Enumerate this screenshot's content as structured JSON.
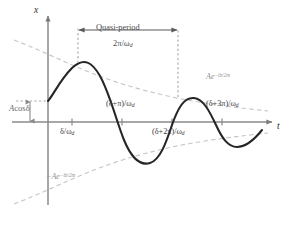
{
  "figure": {
    "background": "#ffffff",
    "curve_color": "#262626",
    "envelope_color": "#c2c2c2",
    "axis_color": "#8a8a8a",
    "dotted_color": "#a8a8a8"
  },
  "axes": {
    "x_axis_label": "x",
    "t_axis_label": "t"
  },
  "annotations": {
    "quasi_period_label": "Quasi-period",
    "quasi_period_value_num": "2π",
    "quasi_period_value_den": "ω",
    "quasi_period_value_den_sub": "d",
    "amplitude_label_a": "A",
    "amplitude_label_cos": "cos",
    "amplitude_label_delta": "δ",
    "envelope_upper_base": "Ae",
    "envelope_upper_exp": "−tb/2m",
    "envelope_lower_base": "−Ae",
    "envelope_lower_exp": "−tb/2m"
  },
  "ticks": [
    {
      "name": "tick-delta-over-omega-d",
      "text_main": "δ/ω",
      "text_sub": "d",
      "position_x": 72,
      "label_x": 60,
      "label_y": 128,
      "below_axis": true
    },
    {
      "name": "tick-delta-plus-pi-over-omega-d",
      "text_main": "(δ+π)/ω",
      "text_sub": "d",
      "position_x": 122,
      "label_x": 106,
      "label_y": 100,
      "below_axis": false
    },
    {
      "name": "tick-delta-plus-2pi-over-omega-d",
      "text_main": "(δ+2π)/ω",
      "text_sub": "d",
      "position_x": 172,
      "label_x": 152,
      "label_y": 128,
      "below_axis": true
    },
    {
      "name": "tick-delta-plus-3pi-over-omega-d",
      "text_main": "(δ+3π)/ω",
      "text_sub": "d",
      "position_x": 222,
      "label_x": 206,
      "label_y": 100,
      "below_axis": false
    }
  ],
  "chart_data": {
    "type": "line",
    "xlabel": "t",
    "ylabel": "x",
    "grid": false,
    "legend": "none",
    "xlim": [
      -0.18,
      3.6
    ],
    "ylim": [
      -1.05,
      1.05
    ],
    "annotations": [
      "Quasi-period 2π/ω_d",
      "A cos δ",
      "Ae^{−tb/2m}",
      "−Ae^{−tb/2m}"
    ],
    "xtick_labels": [
      "δ/ω_d",
      "(δ+π)/ω_d",
      "(δ+2π)/ω_d",
      "(δ+3π)/ω_d"
    ],
    "xtick_values": [
      0.48,
      1.48,
      2.48,
      3.48
    ],
    "series": [
      {
        "name": "damped-oscillation",
        "style": "solid",
        "color": "#262626",
        "x": [
          0.0,
          0.06,
          0.12,
          0.18,
          0.24,
          0.3,
          0.36,
          0.42,
          0.48,
          0.54,
          0.6,
          0.66,
          0.72,
          0.78,
          0.84,
          0.9,
          0.96,
          1.02,
          1.08,
          1.14,
          1.2,
          1.26,
          1.32,
          1.38,
          1.44,
          1.5,
          1.56,
          1.62,
          1.68,
          1.74,
          1.8,
          1.86,
          1.92,
          1.98,
          2.04,
          2.1,
          2.16,
          2.22,
          2.28,
          2.34,
          2.4,
          2.46,
          2.52,
          2.58,
          2.64,
          2.7,
          2.76,
          2.82,
          2.88,
          2.94,
          3.0,
          3.06,
          3.12,
          3.18,
          3.24,
          3.3,
          3.36,
          3.42,
          3.48
        ],
        "y": [
          0.424,
          0.527,
          0.623,
          0.708,
          0.778,
          0.832,
          0.867,
          0.883,
          0.879,
          0.856,
          0.815,
          0.757,
          0.684,
          0.599,
          0.503,
          0.4,
          0.292,
          0.182,
          0.073,
          -0.033,
          -0.135,
          -0.23,
          -0.316,
          -0.392,
          -0.456,
          -0.507,
          -0.545,
          -0.569,
          -0.579,
          -0.576,
          -0.56,
          -0.532,
          -0.493,
          -0.444,
          -0.387,
          -0.323,
          -0.254,
          -0.181,
          -0.107,
          -0.033,
          0.04,
          0.11,
          0.175,
          0.235,
          0.288,
          0.333,
          0.369,
          0.396,
          0.414,
          0.422,
          0.421,
          0.411,
          0.393,
          0.368,
          0.336,
          0.299,
          0.257,
          0.212,
          0.166
        ]
      },
      {
        "name": "envelope-upper",
        "style": "dashed",
        "color": "#c2c2c2",
        "label": "Ae^{−tb/2m}",
        "x": [
          -0.18,
          0.4,
          1.0,
          1.6,
          2.2,
          2.8,
          3.4,
          3.6
        ],
        "y": [
          1.0,
          0.885,
          0.772,
          0.672,
          0.586,
          0.511,
          0.445,
          0.425
        ]
      },
      {
        "name": "envelope-lower",
        "style": "dashed",
        "color": "#c2c2c2",
        "label": "−Ae^{−tb/2m}",
        "x": [
          -0.18,
          0.4,
          1.0,
          1.6,
          2.2,
          2.8,
          3.4,
          3.6
        ],
        "y": [
          -1.0,
          -0.885,
          -0.772,
          -0.672,
          -0.586,
          -0.511,
          -0.445,
          -0.425
        ]
      }
    ]
  }
}
